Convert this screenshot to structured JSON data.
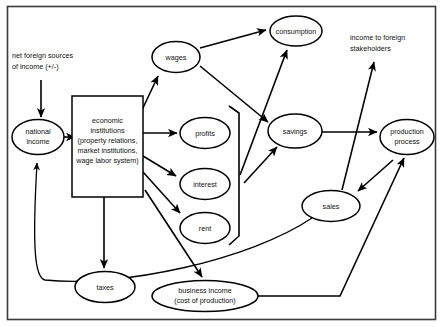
{
  "diagram": {
    "type": "flow-diagram",
    "frame": {
      "stroke": "#3a3a3a"
    },
    "nodes": [
      {
        "id": "national-income",
        "shape": "ellipse",
        "lines": [
          "national",
          "income"
        ]
      },
      {
        "id": "economic-institutions",
        "shape": "rect",
        "lines": [
          "economic",
          "institutions",
          "(property relations,",
          "market institutions,",
          "wage labor system)"
        ]
      },
      {
        "id": "wages",
        "shape": "ellipse",
        "lines": [
          "wages"
        ]
      },
      {
        "id": "profits",
        "shape": "ellipse",
        "lines": [
          "profits"
        ]
      },
      {
        "id": "interest",
        "shape": "ellipse",
        "lines": [
          "interest"
        ]
      },
      {
        "id": "rent",
        "shape": "ellipse",
        "lines": [
          "rent"
        ]
      },
      {
        "id": "taxes",
        "shape": "ellipse",
        "lines": [
          "taxes"
        ]
      },
      {
        "id": "business-income",
        "shape": "ellipse",
        "lines": [
          "business income",
          "(cost of production)"
        ]
      },
      {
        "id": "consumption",
        "shape": "ellipse",
        "lines": [
          "consumption"
        ]
      },
      {
        "id": "savings",
        "shape": "ellipse",
        "lines": [
          "savings"
        ]
      },
      {
        "id": "sales",
        "shape": "ellipse",
        "lines": [
          "sales"
        ]
      },
      {
        "id": "production-process",
        "shape": "ellipse",
        "lines": [
          "production",
          "process"
        ]
      }
    ],
    "annotations": [
      {
        "id": "net-foreign-sources",
        "lines": [
          "net foreign sources",
          "of income (+/-)"
        ]
      },
      {
        "id": "income-to-foreign-stakeholders",
        "lines": [
          "income to foreign",
          "stakeholders"
        ]
      }
    ],
    "labels": {
      "national_income_l1": "national",
      "national_income_l2": "income",
      "institutions_l1": "economic",
      "institutions_l2": "institutions",
      "institutions_l3": "(property relations,",
      "institutions_l4": "market institutions,",
      "institutions_l5": "wage labor system)",
      "wages": "wages",
      "profits": "profits",
      "interest": "interest",
      "rent": "rent",
      "taxes": "taxes",
      "business_income_l1": "business income",
      "business_income_l2": "(cost of production)",
      "consumption": "consumption",
      "savings": "savings",
      "sales": "sales",
      "production_process_l1": "production",
      "production_process_l2": "process",
      "net_foreign_l1": "net foreign sources",
      "net_foreign_l2": "of income (+/-)",
      "foreign_stake_l1": "income to foreign",
      "foreign_stake_l2": "stakeholders"
    },
    "edges": [
      {
        "from": "net-foreign-sources",
        "to": "national-income",
        "arrow": true
      },
      {
        "from": "national-income",
        "to": "economic-institutions",
        "arrow": true
      },
      {
        "from": "economic-institutions",
        "to": "wages",
        "arrow": true
      },
      {
        "from": "economic-institutions",
        "to": "profits",
        "arrow": true
      },
      {
        "from": "economic-institutions",
        "to": "interest",
        "arrow": true
      },
      {
        "from": "economic-institutions",
        "to": "rent",
        "arrow": true
      },
      {
        "from": "economic-institutions",
        "to": "taxes",
        "arrow": true
      },
      {
        "from": "economic-institutions",
        "to": "business-income",
        "arrow": true
      },
      {
        "from": "wages",
        "to": "consumption",
        "arrow": true
      },
      {
        "from": "wages",
        "to": "savings",
        "arrow": true
      },
      {
        "from": "income-bracket",
        "to": "savings",
        "arrow": true
      },
      {
        "from": "income-bracket",
        "to": "consumption",
        "arrow": true
      },
      {
        "from": "savings",
        "to": "production-process",
        "arrow": true
      },
      {
        "from": "production-process",
        "to": "sales",
        "arrow": true
      },
      {
        "from": "sales",
        "to": "income-to-foreign-stakeholders",
        "arrow": true
      },
      {
        "from": "sales",
        "to": "national-income",
        "arrow": true
      },
      {
        "from": "business-income",
        "to": "production-process",
        "arrow": true
      }
    ]
  }
}
